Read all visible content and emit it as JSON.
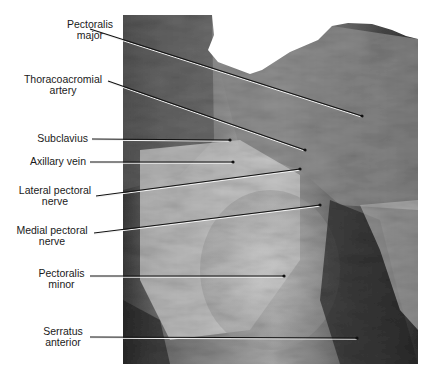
{
  "figure": {
    "type": "anatomical-photograph",
    "colors": {
      "background": "#ffffff",
      "leader_line": "#111111",
      "leader_highlight": "#f2f2f2",
      "label_text": "#1a1a1a"
    }
  },
  "labels": [
    {
      "id": "pectoralis-major",
      "lines": [
        "Pectoralis",
        "major"
      ]
    },
    {
      "id": "thoracoacromial-artery",
      "lines": [
        "Thoracoacromial",
        "artery"
      ]
    },
    {
      "id": "subclavius",
      "lines": [
        "Subclavius"
      ]
    },
    {
      "id": "axillary-vein",
      "lines": [
        "Axillary vein"
      ]
    },
    {
      "id": "lateral-pectoral-nerve",
      "lines": [
        "Lateral pectoral",
        "nerve"
      ]
    },
    {
      "id": "medial-pectoral-nerve",
      "lines": [
        "Medial pectoral",
        "nerve"
      ]
    },
    {
      "id": "pectoralis-minor",
      "lines": [
        "Pectoralis",
        "minor"
      ]
    },
    {
      "id": "serratus-anterior",
      "lines": [
        "Serratus",
        "anterior"
      ]
    }
  ]
}
